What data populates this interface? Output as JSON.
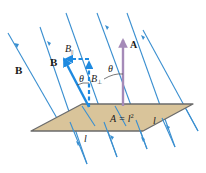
{
  "colors": {
    "field_line": "#3a8fd0",
    "vector_B": "#1e8ae0",
    "area_vector": "#a58ab8",
    "plane_fill": "#d9c49a",
    "plane_edge": "#6b6b6b",
    "text": "#1a1a1a"
  },
  "labels": {
    "field_B": "B",
    "vector_B": "B",
    "B_parallel_base": "B",
    "B_parallel_sub": "||",
    "B_perp_base": "B",
    "B_perp_sub": "⊥",
    "theta_1": "θ",
    "theta_2": "θ",
    "area_vector": "A",
    "area_eq": "A = l",
    "area_exp": "2",
    "side_1": "l",
    "side_2": "l"
  },
  "field_lines": [
    {
      "x1": 8,
      "y1": 33,
      "x2": 58,
      "y2": 120
    },
    {
      "x1": 40,
      "y1": 27,
      "x2": 87,
      "y2": 164
    },
    {
      "x1": 66,
      "y1": 13,
      "x2": 117,
      "y2": 157
    },
    {
      "x1": 97,
      "y1": 13,
      "x2": 147,
      "y2": 149
    },
    {
      "x1": 127,
      "y1": 13,
      "x2": 175,
      "y2": 147
    },
    {
      "x1": 143,
      "y1": 30,
      "x2": 198,
      "y2": 131
    }
  ]
}
